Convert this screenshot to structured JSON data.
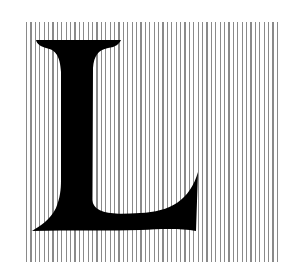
{
  "image": {
    "letter": "L",
    "description": "Black serif capital letter L over a field of thin vertical gray lines",
    "colors": {
      "background": "#ffffff",
      "stripes": "#8a8a8a",
      "letter": "#000000"
    },
    "stripe_spacing_px": 4.4
  }
}
